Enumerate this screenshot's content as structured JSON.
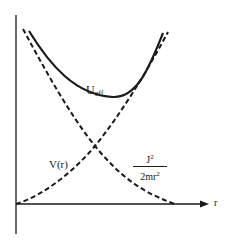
{
  "figure": {
    "axes": {
      "x_label": "r",
      "y_axis": "vertical line, no label"
    },
    "curves": [
      {
        "id": "u_eff",
        "label": "U",
        "label_sub": "eff",
        "style": "solid"
      },
      {
        "id": "v_r",
        "label": "V(r)",
        "style": "dashed"
      },
      {
        "id": "centrifugal",
        "label_numerator": "J",
        "label_numerator_sup": "2",
        "label_denominator": "2mr",
        "label_denominator_sup": "2",
        "style": "dashed"
      }
    ],
    "colors": {
      "ink": "#1a1a1a",
      "background": "#ffffff"
    }
  }
}
